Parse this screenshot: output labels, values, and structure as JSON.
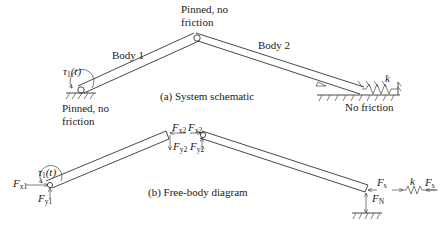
{
  "figure": {
    "schematic": {
      "caption": "(a) System schematic",
      "top_pin_label_line1": "Pinned, no",
      "top_pin_label_line2": "friction",
      "bottom_pin_label_line1": "Pinned, no",
      "bottom_pin_label_line2": "friction",
      "body1_label": "Body 1",
      "body2_label": "Body 2",
      "torque_label": "τ",
      "torque_sub": "1",
      "torque_arg": "(t)",
      "spring_label": "k",
      "slider_label": "No friction"
    },
    "fbd": {
      "caption": "(b) Free-body diagram",
      "torque_label": "τ",
      "torque_sub": "1",
      "torque_arg": "(t)",
      "fx1": {
        "main": "F",
        "sub": "x1"
      },
      "fy1": {
        "main": "F",
        "sub": "y1"
      },
      "fx2_body1": {
        "main": "F",
        "sub": "x2"
      },
      "fy2_body1": {
        "main": "F",
        "sub": "y2"
      },
      "fx2_body2": {
        "main": "F",
        "sub": "x2"
      },
      "fy2_body2": {
        "main": "F",
        "sub": "y2"
      },
      "fs_body": {
        "main": "F",
        "sub": "s"
      },
      "fn": {
        "main": "F",
        "sub": "N"
      },
      "spring_label": "k",
      "fs_spring": {
        "main": "F",
        "sub": "s"
      }
    }
  }
}
